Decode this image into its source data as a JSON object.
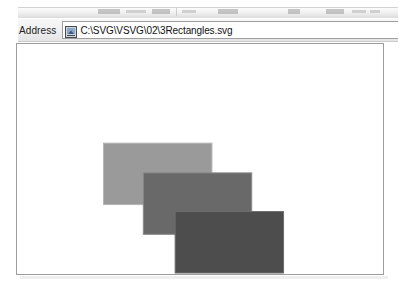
{
  "toolbar": {
    "strip_label": "browser-toolbar-clipped"
  },
  "address": {
    "label": "Address",
    "file_icon_name": "svg-file-icon",
    "path": "C:\\SVG\\VSVG\\02\\3Rectangles.svg",
    "placeholder": "C:\\SVG\\VSVG\\02\\3Rectangles.svg"
  },
  "canvas": {
    "background": "#ffffff",
    "border_color": "#9d9d9d",
    "width": 368,
    "height": 232
  },
  "chart_data": {
    "type": "diagram",
    "title": "3Rectangles.svg",
    "viewbox": [
      0,
      0,
      368,
      232
    ],
    "shapes": [
      {
        "name": "rectangle-1",
        "kind": "rect",
        "x": 87,
        "y": 100,
        "width": 109,
        "height": 62,
        "fill": "#9a9a9a",
        "stroke": "#b5b5b5",
        "stroke_width": 1,
        "order": 1
      },
      {
        "name": "rectangle-2",
        "kind": "rect",
        "x": 127,
        "y": 130,
        "width": 109,
        "height": 62,
        "fill": "#696969",
        "stroke": "#8a8a8a",
        "stroke_width": 1,
        "order": 2
      },
      {
        "name": "rectangle-3",
        "kind": "rect",
        "x": 159,
        "y": 169,
        "width": 109,
        "height": 62,
        "fill": "#4d4d4d",
        "stroke": "#6d6d6d",
        "stroke_width": 1,
        "order": 3
      }
    ]
  }
}
